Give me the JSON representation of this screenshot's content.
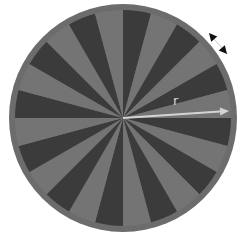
{
  "diagram": {
    "title": "",
    "type": "radial-wedge-disk",
    "center": {
      "x": 123,
      "y": 118
    },
    "outer_radius": 114,
    "inner_radius": 108,
    "wedge_count": 24,
    "wedge_angle_deg": 15,
    "first_dark_start_deg": 0,
    "colors": {
      "background": "#ffffff",
      "rim": "#6c6c6c",
      "light_wedge": "#747474",
      "dark_wedge": "#3b3b3b",
      "radius_arrow": "#d4d4d4",
      "dimension_arrow": "#111111",
      "dimension_line": "#bdbdbd"
    },
    "radius_arrow": {
      "label": "r",
      "x1": 123,
      "y1": 118,
      "x2": 229,
      "y2": 111,
      "label_x": 173,
      "label_y": 105
    },
    "dimension_marker": {
      "tip1": {
        "x": 209,
        "y": 33
      },
      "tip2": {
        "x": 227,
        "y": 54
      }
    }
  }
}
